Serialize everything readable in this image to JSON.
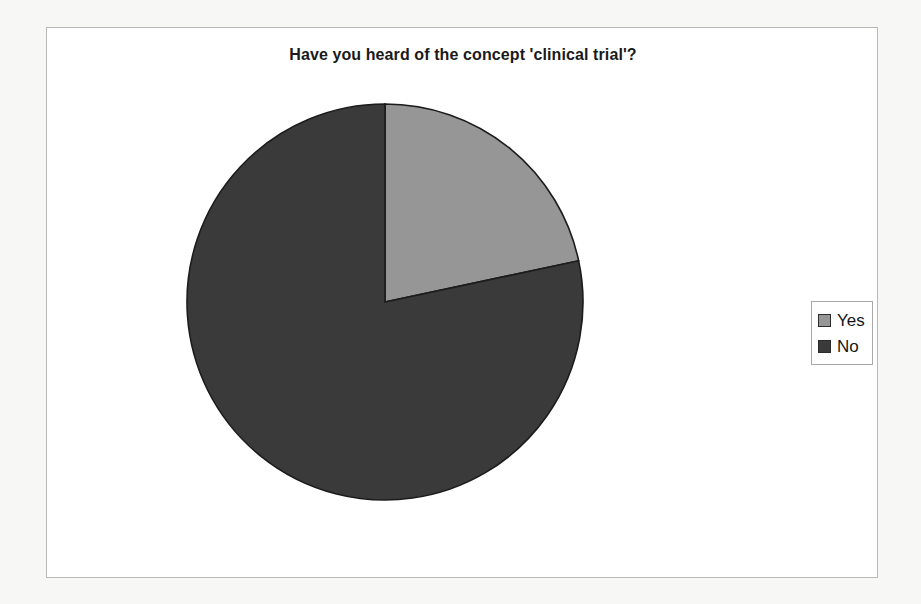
{
  "chart_data": {
    "type": "pie",
    "title": "Have you heard of the concept 'clinical trial'?",
    "categories": [
      "Yes",
      "No"
    ],
    "values": [
      21.7,
      78.3
    ],
    "units": "percent",
    "start_angle_deg": 0,
    "direction": "clockwise",
    "legend_position": "right",
    "grid": false,
    "labels_shown": false,
    "slices": [
      {
        "label": "Yes",
        "value": 21.7,
        "color": "#969696",
        "start_angle_deg": 0,
        "end_angle_deg": 78
      },
      {
        "label": "No",
        "value": 78.3,
        "color": "#3a3a3a",
        "start_angle_deg": 78,
        "end_angle_deg": 360
      }
    ],
    "xlabel": "",
    "ylabel": ""
  },
  "figure": {
    "title": "Have you heard of the concept 'clinical trial'?",
    "background": "#ffffff",
    "page_background": "#f7f7f5",
    "border_color": "#b9b9b9"
  },
  "legend": {
    "border_color": "#a8a8a8",
    "entries": [
      {
        "label": "Yes",
        "color": "#969696",
        "swatch_name": "legend-swatch-yes"
      },
      {
        "label": "No",
        "color": "#3a3a3a",
        "swatch_name": "legend-swatch-no"
      }
    ]
  }
}
